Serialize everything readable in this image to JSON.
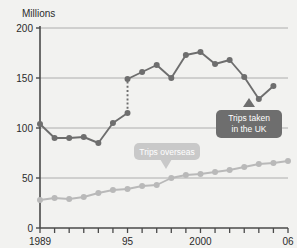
{
  "chart_data": {
    "type": "line",
    "title": "",
    "ylabel": "Millions",
    "xlabel": "",
    "ylim": [
      0,
      200
    ],
    "yticks": [
      0,
      50,
      100,
      150,
      200
    ],
    "ytick_labels": [
      "0",
      "50",
      "100",
      "150",
      "200"
    ],
    "xlim": [
      1989,
      2006
    ],
    "xticks": [
      1989,
      1990,
      1991,
      1992,
      1993,
      1994,
      1995,
      1996,
      1997,
      1998,
      1999,
      2000,
      2001,
      2002,
      2003,
      2004,
      2005,
      2006
    ],
    "xtick_labels_shown": [
      "1989",
      "95",
      "2000",
      "06"
    ],
    "xtick_labels_shown_at": [
      1989,
      1995,
      2000,
      2006
    ],
    "grid": "horizontal",
    "legend_position": "inline-callouts",
    "series": [
      {
        "name": "Trips taken in the UK",
        "color": "#6e6e6e",
        "break_at_x": 1995,
        "note": "series break shown as vertical dotted line at 1995",
        "x": [
          1989,
          1990,
          1991,
          1992,
          1993,
          1994,
          1995,
          1995,
          1996,
          1997,
          1998,
          1999,
          2000,
          2001,
          2002,
          2003,
          2004,
          2005
        ],
        "values": [
          104,
          90,
          90,
          91,
          85,
          105,
          115,
          149,
          156,
          163,
          150,
          173,
          176,
          164,
          168,
          151,
          129,
          142
        ]
      },
      {
        "name": "Trips overseas",
        "color": "#b9b9b9",
        "x": [
          1989,
          1990,
          1991,
          1992,
          1993,
          1994,
          1995,
          1996,
          1997,
          1998,
          1999,
          2000,
          2001,
          2002,
          2003,
          2004,
          2005,
          2006
        ],
        "values": [
          28,
          30,
          29,
          31,
          35,
          38,
          39,
          42,
          43,
          50,
          53,
          54,
          56,
          58,
          61,
          64,
          65,
          67
        ]
      }
    ],
    "annotations": [
      {
        "name": "trips-uk-callout",
        "text_line1": "Trips taken",
        "text_line2": "in the UK",
        "color": "#6e6e6e",
        "text_color": "#ffffff",
        "points_to_series": "Trips taken in the UK"
      },
      {
        "name": "trips-overseas-callout",
        "text_line1": "Trips overseas",
        "text_line2": "",
        "color": "#c9c9c9",
        "text_color": "#ffffff",
        "points_to_series": "Trips overseas"
      }
    ]
  },
  "axis": {
    "y_title": "Millions",
    "y_labels": [
      "200",
      "150",
      "100",
      "50",
      "0"
    ],
    "x_labels": [
      "1989",
      "95",
      "2000",
      "06"
    ]
  },
  "callouts": {
    "uk": {
      "line1": "Trips taken",
      "line2": "in the UK"
    },
    "overseas": {
      "line1": "Trips overseas"
    }
  },
  "colors": {
    "background": "#f2f2f0",
    "dark_series": "#6e6e6e",
    "light_series": "#b9b9b9",
    "grid": "#9a9a9a",
    "axis": "#4a4a4a",
    "text": "#2b2b2b",
    "callout_dark": "#6e6e6e",
    "callout_light": "#c9c9c9"
  }
}
